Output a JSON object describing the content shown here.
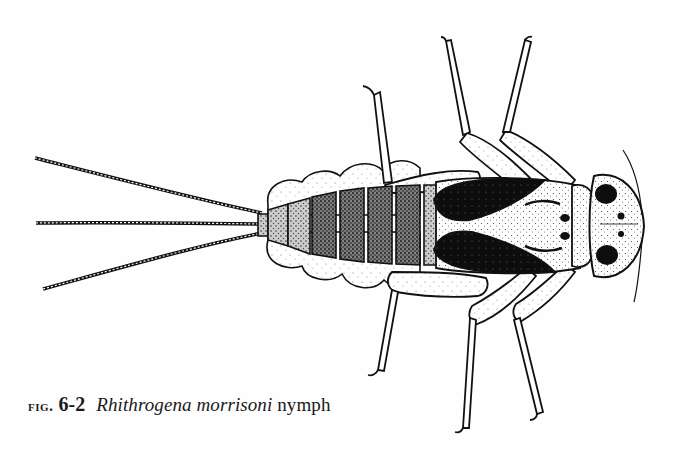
{
  "figure": {
    "label": "fig.",
    "number": "6-2",
    "species": "Rhithrogena morrisoni",
    "stage": "nymph",
    "illustration": "mayfly-nymph-dorsal-view",
    "ink_color": "#111111",
    "paper_color": "#fefefe"
  }
}
